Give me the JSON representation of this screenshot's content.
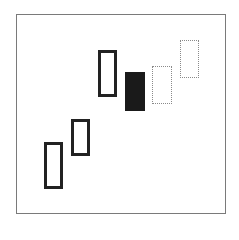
{
  "diagram": {
    "type": "candlestick-pattern",
    "frame": {
      "x": 16,
      "y": 14,
      "width": 210,
      "height": 200,
      "border_color": "#7a7a7a"
    },
    "candles": [
      {
        "id": 1,
        "style": "hollow",
        "x": 44,
        "y": 142,
        "width": 19,
        "height": 47
      },
      {
        "id": 2,
        "style": "hollow",
        "x": 71,
        "y": 119,
        "width": 19,
        "height": 37
      },
      {
        "id": 3,
        "style": "hollow",
        "x": 98,
        "y": 50,
        "width": 19,
        "height": 47
      },
      {
        "id": 4,
        "style": "filled",
        "x": 125,
        "y": 72,
        "width": 20,
        "height": 39
      },
      {
        "id": 5,
        "style": "dotted",
        "x": 152,
        "y": 66,
        "width": 20,
        "height": 38
      },
      {
        "id": 6,
        "style": "dotted",
        "x": 180,
        "y": 40,
        "width": 19,
        "height": 38
      }
    ],
    "colors": {
      "hollow_border": "#222222",
      "filled": "#1a1a1a",
      "dotted_border": "#8a8a8a"
    }
  }
}
